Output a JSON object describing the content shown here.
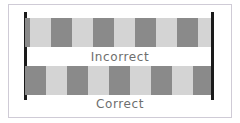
{
  "figure": {
    "background_color": "#ffffff",
    "frame_border_color": "#cfcbd6",
    "boundary_line_color": "#1a1a1a",
    "light_tile_color": "#d4d4d4",
    "dark_tile_color": "#8a8a8a",
    "caption_color": "#6e6e6e"
  },
  "boundaries": {
    "left_label": "left-boundary-line",
    "right_label": "right-boundary-line"
  },
  "rows": [
    {
      "id": "incorrect",
      "caption": "Incorrect",
      "description": "Repeating tile pattern does not line up with the boundary lines; the first and last tiles are clipped.",
      "tile_width_px": 21,
      "offset_px": -16,
      "tiles": [
        {
          "shade": "dark",
          "width": 5,
          "clipped": true
        },
        {
          "shade": "light",
          "width": 21,
          "clipped": false
        },
        {
          "shade": "dark",
          "width": 21,
          "clipped": false
        },
        {
          "shade": "light",
          "width": 21,
          "clipped": false
        },
        {
          "shade": "dark",
          "width": 21,
          "clipped": false
        },
        {
          "shade": "light",
          "width": 21,
          "clipped": false
        },
        {
          "shade": "dark",
          "width": 21,
          "clipped": false
        },
        {
          "shade": "light",
          "width": 21,
          "clipped": false
        },
        {
          "shade": "dark",
          "width": 21,
          "clipped": false
        },
        {
          "shade": "light",
          "width": 13,
          "clipped": true
        }
      ]
    },
    {
      "id": "correct",
      "caption": "Correct",
      "description": "Repeating tile pattern aligns exactly with the boundary lines; whole tiles at both edges.",
      "tile_width_px": 20.67,
      "offset_px": 0,
      "tiles": [
        {
          "shade": "dark",
          "width": 21,
          "clipped": false
        },
        {
          "shade": "light",
          "width": 21,
          "clipped": false
        },
        {
          "shade": "dark",
          "width": 21,
          "clipped": false
        },
        {
          "shade": "light",
          "width": 21,
          "clipped": false
        },
        {
          "shade": "dark",
          "width": 21,
          "clipped": false
        },
        {
          "shade": "light",
          "width": 21,
          "clipped": false
        },
        {
          "shade": "dark",
          "width": 21,
          "clipped": false
        },
        {
          "shade": "light",
          "width": 21,
          "clipped": false
        },
        {
          "shade": "dark",
          "width": 18,
          "clipped": false
        }
      ]
    }
  ]
}
